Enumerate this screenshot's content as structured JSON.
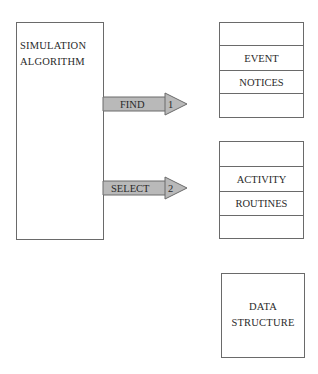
{
  "algorithm_box": {
    "line1": "SIMULATION",
    "line2": "ALGORITHM"
  },
  "arrows": [
    {
      "label": "FIND",
      "number": "1",
      "target": "EVENT NOTICES"
    },
    {
      "label": "SELECT",
      "number": "2",
      "target": "ACTIVITY ROUTINES"
    }
  ],
  "event_notices_box": {
    "rows": [
      "",
      "EVENT",
      "NOTICES",
      ""
    ]
  },
  "activity_routines_box": {
    "rows": [
      "",
      "ACTIVITY",
      "ROUTINES",
      ""
    ]
  },
  "data_structure_box": {
    "line1": "DATA",
    "line2": "STRUCTURE"
  },
  "colors": {
    "arrow_fill": "#b9b9b9",
    "stroke": "#6a6a6a",
    "text": "#2a2a2a"
  }
}
